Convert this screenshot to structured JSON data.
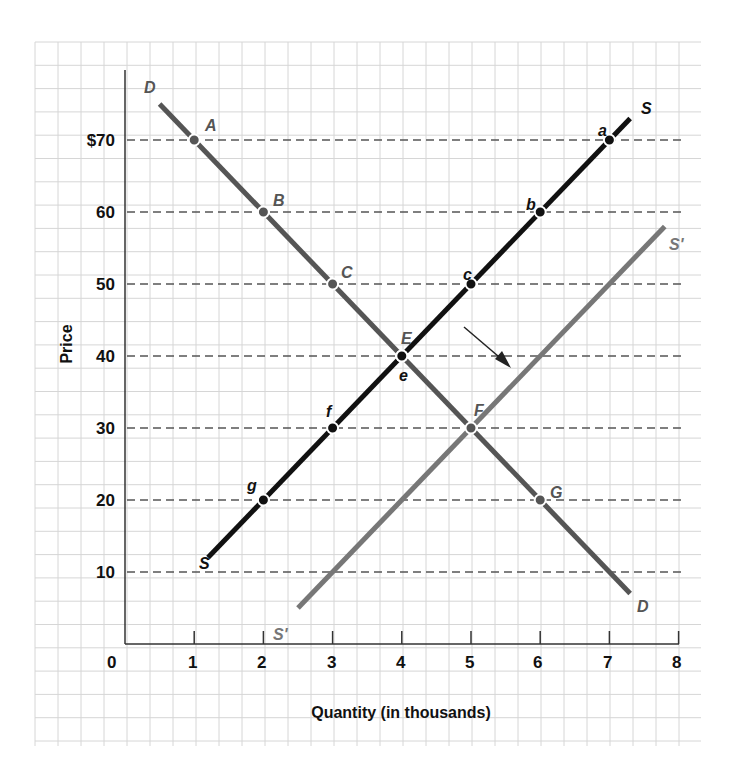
{
  "chart_data": {
    "type": "line",
    "title": "",
    "xlabel": "Quantity (in thousands)",
    "ylabel": "Price",
    "xlim": [
      0,
      8
    ],
    "ylim": [
      0,
      80
    ],
    "x_ticks": [
      0,
      1,
      2,
      3,
      4,
      5,
      6,
      7,
      8
    ],
    "x_tick_labels": [
      "0",
      "1",
      "2",
      "3",
      "4",
      "5",
      "6",
      "7",
      "8"
    ],
    "y_ticks": [
      10,
      20,
      30,
      40,
      50,
      60,
      70
    ],
    "y_tick_labels": [
      "10",
      "20",
      "30",
      "40",
      "50",
      "60",
      "$70"
    ],
    "grid": true,
    "dashed_price_guides": [
      10,
      20,
      30,
      40,
      50,
      60,
      70
    ],
    "series": [
      {
        "name": "D",
        "end_labels": [
          "D",
          "D"
        ],
        "color": "#555555",
        "line": [
          [
            0.5,
            75
          ],
          [
            7.3,
            7
          ]
        ],
        "points": [
          {
            "label": "A",
            "x": 1,
            "y": 70
          },
          {
            "label": "B",
            "x": 2,
            "y": 60
          },
          {
            "label": "C",
            "x": 3,
            "y": 50
          },
          {
            "label": "E",
            "x": 4,
            "y": 40
          },
          {
            "label": "F",
            "x": 5,
            "y": 30
          },
          {
            "label": "G",
            "x": 6,
            "y": 20
          }
        ]
      },
      {
        "name": "S",
        "end_labels": [
          "S",
          "S"
        ],
        "color": "#111111",
        "line": [
          [
            1.2,
            12
          ],
          [
            7.3,
            73
          ]
        ],
        "points": [
          {
            "label": "g",
            "x": 2,
            "y": 20
          },
          {
            "label": "f",
            "x": 3,
            "y": 30
          },
          {
            "label": "e",
            "x": 4,
            "y": 40
          },
          {
            "label": "c",
            "x": 5,
            "y": 50
          },
          {
            "label": "b",
            "x": 6,
            "y": 60
          },
          {
            "label": "a",
            "x": 7,
            "y": 70
          }
        ]
      },
      {
        "name": "S'",
        "end_labels": [
          "S'",
          "S'"
        ],
        "color": "#777777",
        "line": [
          [
            2.5,
            5
          ],
          [
            7.8,
            58
          ]
        ],
        "points": [
          {
            "label": "F",
            "x": 5,
            "y": 30
          }
        ]
      }
    ],
    "annotations": [
      {
        "type": "arrow",
        "description": "shift of supply curve to the right",
        "from": [
          4.9,
          44
        ],
        "to": [
          5.5,
          38
        ]
      }
    ]
  },
  "labels": {
    "x_axis_title": "Quantity (in thousands)",
    "y_axis_title": "Price",
    "origin": "0",
    "x": [
      "1",
      "2",
      "3",
      "4",
      "5",
      "6",
      "7",
      "8"
    ],
    "y": [
      "$70",
      "60",
      "50",
      "40",
      "30",
      "20",
      "10"
    ],
    "curve_D_top": "D",
    "curve_D_bottom": "D",
    "curve_S_top": "S",
    "curve_S_bottom": "S",
    "curve_Sp_top": "S'",
    "curve_Sp_bottom": "S'",
    "pt_A": "A",
    "pt_B": "B",
    "pt_C": "C",
    "pt_E": "E",
    "pt_F": "F",
    "pt_G": "G",
    "pt_a": "a",
    "pt_b": "b",
    "pt_c": "c",
    "pt_e": "e",
    "pt_f": "f",
    "pt_g": "g"
  },
  "colors": {
    "grid": "#d6d6d6",
    "axis": "#333333",
    "demand": "#555555",
    "supply": "#111111",
    "supply_shifted": "#777777",
    "guide": "#555555"
  }
}
